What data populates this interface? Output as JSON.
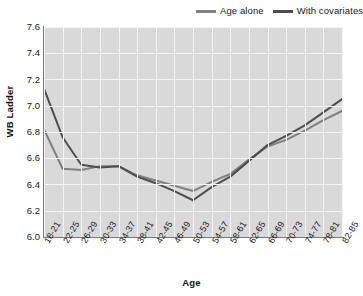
{
  "legend": {
    "position": "top-right",
    "entries": [
      {
        "label": "Age alone",
        "color": "#808080",
        "icon": "line-swatch"
      },
      {
        "label": "With covariates",
        "color": "#4d4d4d",
        "icon": "line-swatch"
      }
    ]
  },
  "axes": {
    "y_title": "WB Ladder",
    "x_title": "Age",
    "y_ticks": [
      "7.6",
      "7.4",
      "7.2",
      "7.0",
      "6.8",
      "6.6",
      "6.4",
      "6.2",
      "6.0"
    ]
  },
  "style": {
    "plot_background": "#d9d9d9",
    "gridline_color": "#f5f5f5",
    "axis_color": "#7a7a7a",
    "series_age_alone_color": "#808080",
    "series_with_covariates_color": "#4d4d4d"
  },
  "chart_data": {
    "type": "line",
    "title": "",
    "subtitle": "",
    "xlabel": "Age",
    "ylabel": "WB Ladder",
    "ylim": [
      6.0,
      7.6
    ],
    "ytick_step": 0.2,
    "grid": true,
    "legend_position": "top-right",
    "categories": [
      "18-21",
      "22-25",
      "26-29",
      "30-33",
      "34-37",
      "38-41",
      "42-45",
      "46-49",
      "50-53",
      "54-57",
      "58-61",
      "62-65",
      "66-69",
      "70-73",
      "74-77",
      "78-81",
      "82-85"
    ],
    "series": [
      {
        "name": "Age alone",
        "color": "#808080",
        "values": [
          6.82,
          6.52,
          6.51,
          6.54,
          6.54,
          6.47,
          6.43,
          6.39,
          6.35,
          6.42,
          6.48,
          6.59,
          6.69,
          6.74,
          6.81,
          6.89,
          6.96
        ]
      },
      {
        "name": "With covariates",
        "color": "#4d4d4d",
        "values": [
          7.13,
          6.76,
          6.55,
          6.53,
          6.54,
          6.46,
          6.41,
          6.35,
          6.28,
          6.38,
          6.46,
          6.58,
          6.7,
          6.77,
          6.85,
          6.95,
          7.05
        ]
      }
    ]
  }
}
